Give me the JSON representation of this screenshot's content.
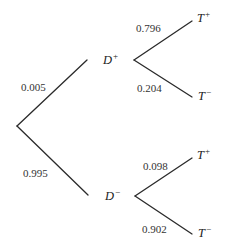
{
  "diagram": {
    "type": "probability-tree",
    "root": {
      "branches": [
        {
          "probability": "0.005",
          "node": {
            "letter": "D",
            "sign": "+"
          },
          "branches": [
            {
              "probability": "0.796",
              "node": {
                "letter": "T",
                "sign": "+"
              }
            },
            {
              "probability": "0.204",
              "node": {
                "letter": "T",
                "sign": "−"
              }
            }
          ]
        },
        {
          "probability": "0.995",
          "node": {
            "letter": "D",
            "sign": "−"
          },
          "branches": [
            {
              "probability": "0.098",
              "node": {
                "letter": "T",
                "sign": "+"
              }
            },
            {
              "probability": "0.902",
              "node": {
                "letter": "T",
                "sign": "−"
              }
            }
          ]
        }
      ]
    }
  }
}
